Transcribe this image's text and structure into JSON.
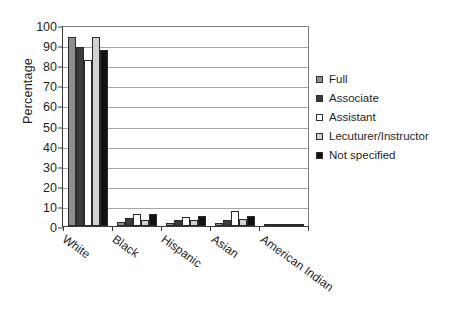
{
  "chart_data": {
    "type": "bar",
    "title": "",
    "subtitle": "",
    "xlabel": "",
    "ylabel": "Percentage",
    "ylim": [
      0,
      100
    ],
    "yticks": [
      0,
      10,
      20,
      30,
      40,
      50,
      60,
      70,
      80,
      90,
      100
    ],
    "grid": true,
    "legend_position": "right",
    "categories": [
      "White",
      "Black",
      "Hispanic",
      "Asian",
      "American Indian"
    ],
    "series": [
      {
        "name": "Full",
        "color": "#8e8e8e",
        "values": [
          94,
          2,
          1.5,
          1.5,
          0.5
        ]
      },
      {
        "name": "Associate",
        "color": "#3b3b3b",
        "values": [
          89,
          4,
          3,
          3,
          0.8
        ]
      },
      {
        "name": "Assistant",
        "color": "#ffffff",
        "values": [
          82.5,
          6,
          4.5,
          7.5,
          0.8
        ]
      },
      {
        "name": "Lecuturer/Instructor",
        "color": "#d2d2d2",
        "values": [
          94,
          3,
          3,
          3.5,
          1
        ]
      },
      {
        "name": "Not specified",
        "color": "#111111",
        "values": [
          87.5,
          6,
          5,
          5,
          1.2
        ]
      }
    ]
  },
  "legend": {
    "items": [
      {
        "label": "Full",
        "swatch": "#8e8e8e"
      },
      {
        "label": "Associate",
        "swatch": "#3b3b3b"
      },
      {
        "label": "Assistant",
        "swatch": "#ffffff"
      },
      {
        "label": "Lecuturer/Instructor",
        "swatch": "#d2d2d2"
      },
      {
        "label": "Not specified",
        "swatch": "#111111"
      }
    ]
  }
}
